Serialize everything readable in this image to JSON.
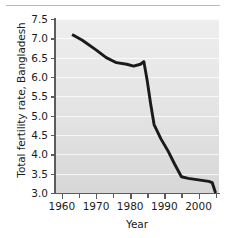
{
  "figure": {
    "background_color": "#ffffff",
    "plot_background_color": "#e3e3e3",
    "line_color": "#1a1a1a",
    "axis_color": "#5c5c5c",
    "text_color": "#1b1b1b",
    "top_rule": "horizontal-rule"
  },
  "chart_data": {
    "type": "line",
    "title": "",
    "xlabel": "Year",
    "ylabel": "Total fertility rate, Bangladesh",
    "xlim": [
      1958,
      2006
    ],
    "ylim": [
      3.0,
      7.5
    ],
    "grid": "horizontal",
    "legend": "none",
    "ytick_labels": [
      "7.5",
      "7.0",
      "6.5",
      "6.0",
      "5.5",
      "5.0",
      "4.5",
      "4.0",
      "3.5",
      "3.0"
    ],
    "ytick_values": [
      7.5,
      7.0,
      6.5,
      6.0,
      5.5,
      5.0,
      4.5,
      4.0,
      3.5,
      3.0
    ],
    "xtick_labels": [
      "1960",
      "1970",
      "1980",
      "1990",
      "2000"
    ],
    "xtick_values": [
      1960,
      1970,
      1980,
      1990,
      2000
    ],
    "xtick_minor_values": [
      1965,
      1975,
      1985,
      1995,
      2005
    ],
    "series": [
      {
        "name": "Total fertility rate, Bangladesh",
        "x": [
          1963,
          1966,
          1970,
          1973,
          1976,
          1979,
          1981,
          1983,
          1984,
          1985,
          1986,
          1987,
          1989,
          1991,
          1993,
          1995,
          1997,
          2000,
          2003,
          2004,
          2005
        ],
        "values": [
          7.1,
          6.95,
          6.7,
          6.5,
          6.37,
          6.33,
          6.28,
          6.33,
          6.4,
          5.9,
          5.3,
          4.77,
          4.4,
          4.1,
          3.75,
          3.42,
          3.38,
          3.34,
          3.3,
          3.27,
          3.0
        ]
      }
    ]
  }
}
